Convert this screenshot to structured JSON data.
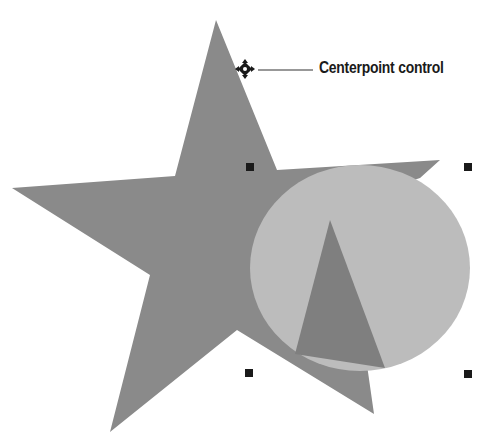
{
  "callout": {
    "label": "Centerpoint control"
  },
  "colors": {
    "star": "#8a8a8a",
    "circle": "#bcbcbc",
    "triangle": "#7f7f7f",
    "handle": "#1a1a1a",
    "leader_line": "#333333",
    "background": "#ffffff"
  },
  "shapes": {
    "star": {
      "points": "216,20 277,170 440,160 418,180 416,180 374,414 237,330 110,432 150,275 12,188 175,176"
    },
    "circle": {
      "cx": 360,
      "cy": 268,
      "rx": 110,
      "ry": 103
    },
    "triangle": {
      "points": "330,220 295,354 385,368"
    }
  },
  "selection_handles": [
    {
      "x": 250,
      "y": 167
    },
    {
      "x": 468,
      "y": 167
    },
    {
      "x": 249,
      "y": 373
    },
    {
      "x": 468,
      "y": 374
    }
  ],
  "centerpoint_handle": {
    "x": 245,
    "y": 69
  }
}
